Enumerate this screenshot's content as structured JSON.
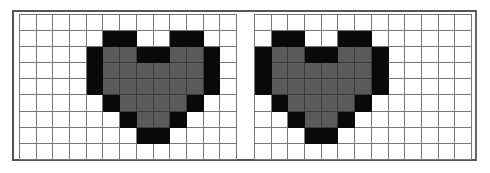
{
  "figure": {
    "grid_size": {
      "columns": 13,
      "rows": 9
    },
    "colors": {
      "empty": "#ffffff",
      "outline": "#0a0a0a",
      "fill": "#5a5a5a",
      "gridline": "#777777"
    },
    "legend": {
      "W": "empty",
      "B": "outline (black)",
      "G": "fill (gray)"
    },
    "panels": [
      {
        "name": "left-grid",
        "rows": [
          "WWWWWWWWWWWWW",
          "WWWWWBBWWBBWW",
          "WWWWBGGBBGGBW",
          "WWWWBGGGGGGBW",
          "WWWWBGGGGGGBW",
          "WWWWWBGGGGBWW",
          "WWWWWWBGGBWWW",
          "WWWWWWWBBWWWW",
          "WWWWWWWWWWWWW"
        ]
      },
      {
        "name": "right-grid",
        "rows": [
          "WWWWWWWWWWWWW",
          "WBBWWBBWWWWWW",
          "BGGBBGGBWWWWW",
          "BGGGGGGBWWWWW",
          "BGGGGGGBWWWWW",
          "WBGGGGBWWWWWW",
          "WWBGGBWWWWWWW",
          "WWWBBWWWWWWWW",
          "WWWWWWWWWWWWW"
        ]
      }
    ]
  }
}
